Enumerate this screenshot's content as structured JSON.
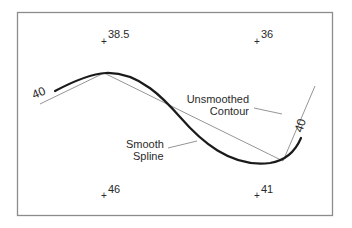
{
  "diagram": {
    "contour_value": "40",
    "contour_label_left": "40",
    "contour_label_right": "40",
    "callouts": {
      "unsmoothed_line1": "Unsmoothed",
      "unsmoothed_line2": "Contour",
      "smooth_line1": "Smooth",
      "smooth_line2": "Spline"
    },
    "spot_heights": [
      {
        "value": "38.5"
      },
      {
        "value": "36"
      },
      {
        "value": "46"
      },
      {
        "value": "41"
      }
    ],
    "colors": {
      "frame": "#8c8c8c",
      "spline": "#1a1a1a",
      "unsmoothed": "#7a7a7a",
      "text": "#2a2a2a"
    }
  }
}
